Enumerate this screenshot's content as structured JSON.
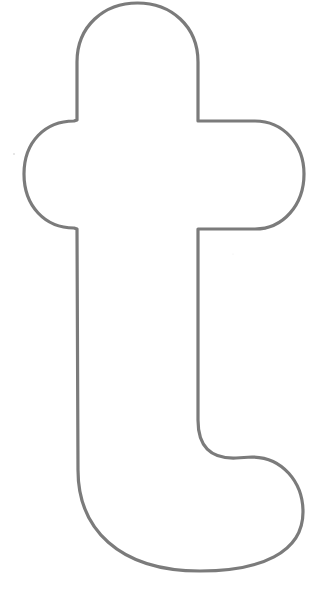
{
  "figure": {
    "letter": "t",
    "background_color": "#ffffff",
    "stroke_color": "#7b7b7b",
    "stroke_width": 3.2,
    "fill_color": "#ffffff"
  },
  "specks": [
    {
      "x": 14,
      "y": 154,
      "color": "#c8c8c8"
    },
    {
      "x": 233,
      "y": 254,
      "color": "#ececec"
    }
  ]
}
